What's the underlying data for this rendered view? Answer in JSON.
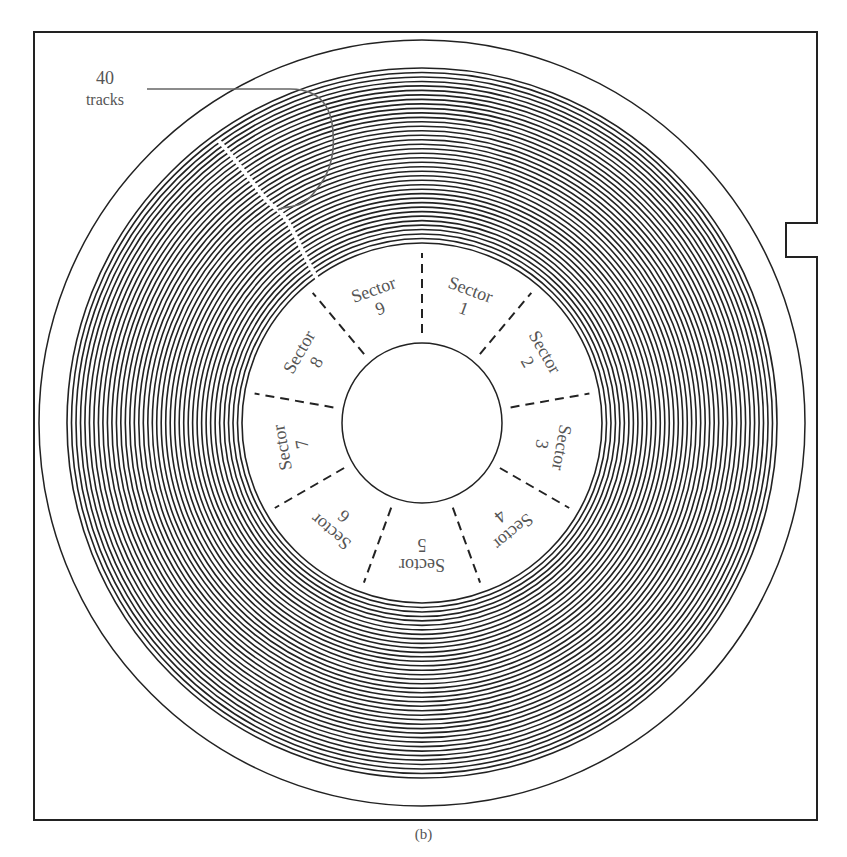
{
  "figure": {
    "caption": "(b)",
    "callout": {
      "line1": "40",
      "line2": "tracks"
    },
    "track_count": 40,
    "sectors": [
      {
        "label": "Sector",
        "number": "1"
      },
      {
        "label": "Sector",
        "number": "2"
      },
      {
        "label": "Sector",
        "number": "3"
      },
      {
        "label": "Sector",
        "number": "4"
      },
      {
        "label": "Sector",
        "number": "5"
      },
      {
        "label": "Sector",
        "number": "6"
      },
      {
        "label": "Sector",
        "number": "7"
      },
      {
        "label": "Sector",
        "number": "8"
      },
      {
        "label": "Sector",
        "number": "9"
      }
    ],
    "colors": {
      "line": "#222222",
      "text": "#555555",
      "background": "#ffffff"
    }
  }
}
